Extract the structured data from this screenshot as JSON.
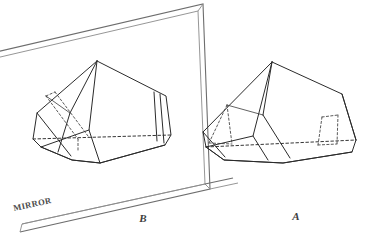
{
  "figure": {
    "background_color": "#ffffff",
    "ink_color": "#2b2b2b",
    "frame_color": "#6d6d6d",
    "width": 371,
    "height": 234
  },
  "mirror": {
    "label": "MIRROR",
    "label_rotation_deg": -12,
    "label_x": 14,
    "label_y": 211,
    "description": "tilted rectangular wall mirror in perspective"
  },
  "labels": {
    "left_figure": "B",
    "right_figure": "A",
    "left_figure_x": 143,
    "left_figure_y": 222,
    "right_figure_x": 296,
    "right_figure_y": 220
  },
  "caption": {
    "cropped_text": ""
  },
  "objects": [
    {
      "name": "crystal-a",
      "label": "A",
      "side": "right",
      "description": "hemimorphic crystal drawn in outline with dashed hidden edges"
    },
    {
      "name": "crystal-b",
      "label": "B",
      "side": "left",
      "description": "mirror reflection of crystal A seen inside the mirror"
    }
  ]
}
